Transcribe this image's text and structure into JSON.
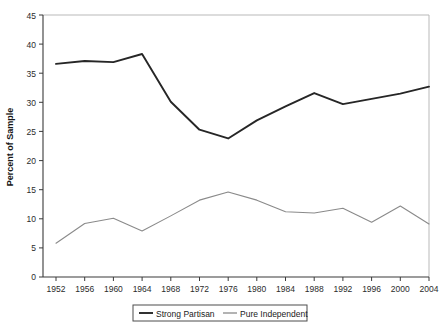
{
  "chart_data": {
    "type": "line",
    "title": "",
    "xlabel": "",
    "ylabel": "Percent of Sample",
    "x": [
      1952,
      1956,
      1960,
      1964,
      1968,
      1972,
      1976,
      1980,
      1984,
      1988,
      1992,
      1996,
      2000,
      2004
    ],
    "categories": [
      "1952",
      "1956",
      "1960",
      "1964",
      "1968",
      "1972",
      "1976",
      "1980",
      "1984",
      "1988",
      "1992",
      "1996",
      "2000",
      "2004"
    ],
    "xlim": [
      1952,
      2004
    ],
    "ylim": [
      0,
      45
    ],
    "ytick_labels": [
      "0",
      "5",
      "10",
      "15",
      "20",
      "25",
      "30",
      "35",
      "40",
      "45"
    ],
    "ytick_values": [
      0,
      5,
      10,
      15,
      20,
      25,
      30,
      35,
      40,
      45
    ],
    "grid": false,
    "legend_position": "bottom-center",
    "series": [
      {
        "name": "Strong Partisan",
        "color": "#262626",
        "width": 1.9,
        "values": [
          36.6,
          37.1,
          36.9,
          38.3,
          30.1,
          25.3,
          23.8,
          26.9,
          29.3,
          31.6,
          29.7,
          30.6,
          31.5,
          32.7
        ]
      },
      {
        "name": "Pure Independent",
        "color": "#8a8a8a",
        "width": 1.1,
        "values": [
          5.8,
          9.2,
          10.1,
          7.9,
          10.5,
          13.2,
          14.6,
          13.2,
          11.2,
          11.0,
          11.8,
          9.4,
          12.2,
          9.1
        ]
      }
    ]
  },
  "legend": {
    "items": [
      {
        "label": "Strong Partisan"
      },
      {
        "label": "Pure Independent"
      }
    ]
  },
  "axes": {
    "y_axis_title": "Percent of Sample"
  }
}
